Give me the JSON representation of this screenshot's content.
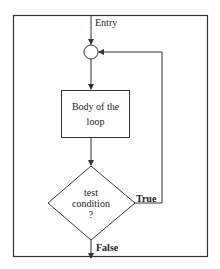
{
  "diagram": {
    "type": "flowchart",
    "title": "",
    "nodes": {
      "entry": {
        "label": "Entry"
      },
      "junction": {
        "shape": "circle"
      },
      "body": {
        "label_line1": "Body of the",
        "label_line2": "loop",
        "shape": "rectangle"
      },
      "condition": {
        "label_line1": "test",
        "label_line2": "condition",
        "label_line3": "?",
        "shape": "diamond"
      }
    },
    "edges": {
      "true_label": "True",
      "false_label": "False"
    },
    "colors": {
      "stroke": "#333333",
      "background": "#ffffff"
    }
  }
}
